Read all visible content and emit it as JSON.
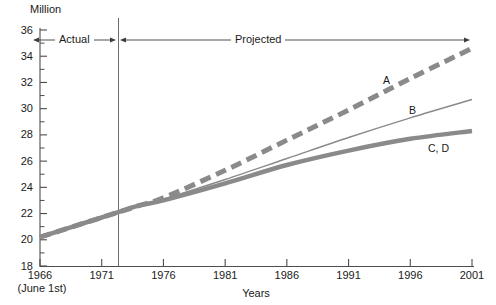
{
  "chart_data": {
    "type": "line",
    "title": "",
    "unit_label": "Million",
    "xlabel": "Years",
    "ylabel": "",
    "x_note": "(June 1st)",
    "xlim": [
      1966,
      2001
    ],
    "ylim": [
      18,
      36
    ],
    "x_ticks": [
      "1966",
      "1971",
      "1976",
      "1981",
      "1986",
      "1991",
      "1996",
      "2001"
    ],
    "y_ticks": [
      "36",
      "34",
      "32",
      "30",
      "28",
      "26",
      "24",
      "22",
      "20",
      "18"
    ],
    "y_minor_step": 1,
    "grid": false,
    "legend": "inline-end-labels",
    "divider_year": 1972,
    "regions": [
      {
        "label": "Actual",
        "from": 1966,
        "to": 1972
      },
      {
        "label": "Projected",
        "from": 1972,
        "to": 2001
      }
    ],
    "series": [
      {
        "name": "A",
        "label": "A",
        "style": "dashed",
        "width": 5,
        "color": "#8a8a8a",
        "x": [
          1966,
          1971,
          1974,
          1976,
          1981,
          1986,
          1991,
          1996,
          2001
        ],
        "values": [
          20.2,
          21.7,
          22.6,
          23.2,
          25.3,
          27.6,
          29.9,
          32.3,
          34.6
        ]
      },
      {
        "name": "B",
        "label": "B",
        "style": "solid",
        "width": 1.4,
        "color": "#8a8a8a",
        "x": [
          1966,
          1971,
          1974,
          1976,
          1981,
          1986,
          1991,
          1996,
          2001
        ],
        "values": [
          20.2,
          21.7,
          22.6,
          23.1,
          24.6,
          26.2,
          27.8,
          29.3,
          30.7
        ]
      },
      {
        "name": "C, D",
        "label": "C, D",
        "style": "solid",
        "width": 4.5,
        "color": "#8a8a8a",
        "x": [
          1966,
          1971,
          1974,
          1976,
          1981,
          1986,
          1991,
          1996,
          2001
        ],
        "values": [
          20.2,
          21.7,
          22.6,
          23.0,
          24.3,
          25.7,
          26.8,
          27.7,
          28.3
        ]
      }
    ],
    "series_label_positions": [
      {
        "label": "A",
        "x": 383,
        "y": 75
      },
      {
        "label": "B",
        "x": 409,
        "y": 105
      },
      {
        "label": "C, D",
        "x": 428,
        "y": 143
      }
    ],
    "axis_color": "#4d4d4d",
    "text_color": "#1a1a1a",
    "background": "#ffffff"
  }
}
